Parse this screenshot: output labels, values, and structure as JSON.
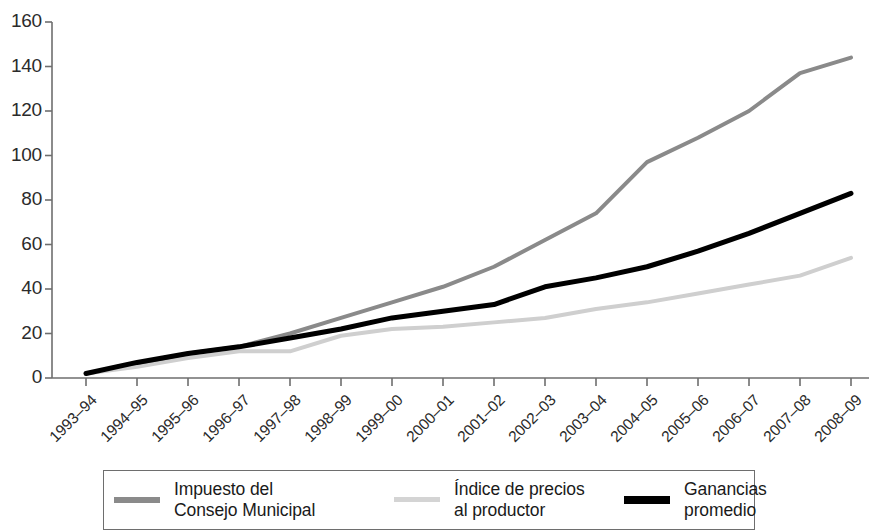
{
  "chart_data": {
    "type": "line",
    "title": "",
    "subtitle": "",
    "xlabel": "",
    "ylabel": "",
    "ylim": [
      0,
      160
    ],
    "ytick_step": 20,
    "yticks": [
      0,
      20,
      40,
      60,
      80,
      100,
      120,
      140,
      160
    ],
    "grid": false,
    "legend_position": "bottom",
    "categories": [
      "1993–94",
      "1994–95",
      "1995–96",
      "1996–97",
      "1997–98",
      "1998–99",
      "1999–00",
      "2000–01",
      "2001–02",
      "2002–03",
      "2003–04",
      "2004–05",
      "2005–06",
      "2006–07",
      "2007–08",
      "2008–09"
    ],
    "series": [
      {
        "name": "Impuesto del Consejo Municipal",
        "color": "#8a8a8a",
        "width": 4,
        "values": [
          2,
          6,
          11,
          14,
          20,
          27,
          34,
          41,
          50,
          62,
          74,
          97,
          108,
          120,
          137,
          144
        ]
      },
      {
        "name": "Índice de precios al productor",
        "color": "#cfcfcf",
        "width": 4,
        "values": [
          2,
          5,
          9,
          12,
          12,
          19,
          22,
          23,
          25,
          27,
          31,
          34,
          38,
          42,
          46,
          54
        ]
      },
      {
        "name": "Ganancias promedio",
        "color": "#000000",
        "width": 5,
        "values": [
          2,
          7,
          11,
          14,
          18,
          22,
          27,
          30,
          33,
          41,
          45,
          50,
          57,
          65,
          74,
          83
        ]
      }
    ]
  },
  "axis": {
    "color": "#6e6e6e",
    "tick_labels_y": [
      "0",
      "20",
      "40",
      "60",
      "80",
      "100",
      "120",
      "140",
      "160"
    ]
  },
  "legend": {
    "entries": [
      {
        "label": "Impuesto del\nConsejo Municipal",
        "color": "#8a8a8a",
        "thickness": 6
      },
      {
        "label": "Índice de precios\nal productor",
        "color": "#d4d4d4",
        "thickness": 5
      },
      {
        "label": "Ganancias\npromedio",
        "color": "#000000",
        "thickness": 8
      }
    ]
  }
}
